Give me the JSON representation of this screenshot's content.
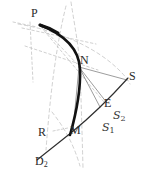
{
  "figure": {
    "type": "geometric-diagram",
    "width": 145,
    "height": 176,
    "background_color": "#ffffff",
    "stroke_colors": {
      "primary_curve": "#1a1a1a",
      "secondary_curve": "#333333",
      "thin_rays": "#555555",
      "dashed_construction": "#b9b9b9",
      "label_text": "#2b2b2b"
    }
  },
  "labels": {
    "p": "P",
    "n": "N",
    "s": "S",
    "e": "E",
    "m": "M",
    "r": "R",
    "d2_letter": "D",
    "d2_sub": "2",
    "script_s2_letter": "S",
    "script_s2_sub": "2",
    "script_s1_letter": "S",
    "script_s1_sub": "1"
  },
  "points": {
    "P": {
      "x": 40,
      "y": 24
    },
    "N": {
      "x": 77,
      "y": 64
    },
    "S": {
      "x": 128,
      "y": 80
    },
    "E": {
      "x": 105,
      "y": 105
    },
    "M": {
      "x": 72,
      "y": 133
    },
    "R": {
      "x": 48,
      "y": 133
    },
    "D2": {
      "x": 40,
      "y": 156
    }
  },
  "curves": {
    "thick_arc_PNM": "M 40 24 C 63 33 79 47 80 68 C 81 92 76 114 70 134",
    "thin_arc_D2_M_E_S": "M 37 160 C 49 150 62 140 73 131 C 88 119 110 98 128 78",
    "ray_N_to_E": "M 78 66 L 106 103",
    "ray_N_to_S": "M 78 66 L 127 80",
    "ray_N_to_E2": "M 78 66 L 101 107",
    "ray_N_to_M": "M 78 66 L 73 130"
  },
  "dashed_construction": {
    "vertical_through_N": "M 71 2 C 75 28 79 48 80 68 C 81 96 82 130 83 168",
    "arc_P_to_S": "M 18 24 C 55 30 96 46 121 72 C 125 76 128 80 130 84",
    "arc_left_PR": "M 66 6 C 56 46 50 96 46 150",
    "arc_R_through_M": "M 52 112 C 63 126 73 142 80 166",
    "chord_P_to_N": "M 41 26 L 79 66",
    "chord_P_to_E": "M 41 27 L 104 102",
    "quad_upper": "M 22 28 L 96 44",
    "quad_lower": "M 25 46 L 98 70",
    "quad_left_v": "M 30 24 L 33 80",
    "tick_R_arrow": "M 52 131 L 67 128",
    "short_tick_top": "M 14 22 L 36 26"
  },
  "meta": {
    "label_count": 9,
    "has_dashed_construction_lines": true
  }
}
